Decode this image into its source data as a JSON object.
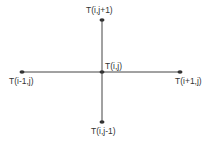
{
  "diagram": {
    "type": "five-point stencil",
    "colors": {
      "line": "#444444",
      "node": "#333333",
      "text": "#333333"
    },
    "nodes": {
      "center": {
        "label": "T(i,j)"
      },
      "top": {
        "label": "T(i,j+1)"
      },
      "bottom": {
        "label": "T(i,j-1)"
      },
      "left": {
        "label": "T(i-1,j)"
      },
      "right": {
        "label": "T(i+1,j)"
      }
    }
  }
}
